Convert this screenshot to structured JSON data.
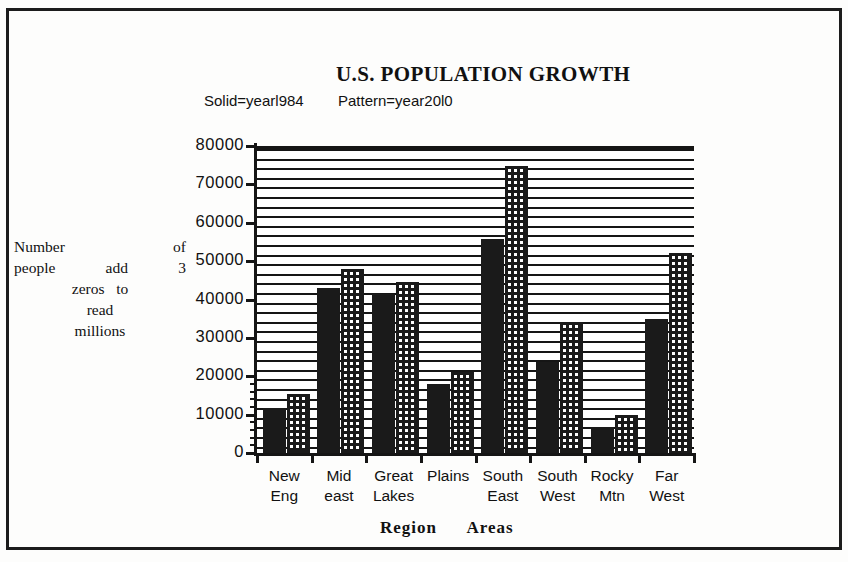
{
  "chart_data": {
    "type": "bar",
    "title": "U.S. POPULATION GROWTH",
    "xlabel": "Region Areas",
    "ylabel": "Number of people add 3 zeros to read millions",
    "categories": [
      "New Eng",
      "Mid east",
      "Great Lakes",
      "Plains",
      "South East",
      "South West",
      "Rocky Mtn",
      "Far West"
    ],
    "category_lines": [
      {
        "l1": "New",
        "l2": "Eng"
      },
      {
        "l1": "Mid",
        "l2": "east"
      },
      {
        "l1": "Great",
        "l2": "Lakes"
      },
      {
        "l1": "Plains",
        "l2": ""
      },
      {
        "l1": "South",
        "l2": "East"
      },
      {
        "l1": "South",
        "l2": "West"
      },
      {
        "l1": "Rocky",
        "l2": "Mtn"
      },
      {
        "l1": "Far",
        "l2": "West"
      }
    ],
    "series": [
      {
        "name": "Solid=yearl984",
        "fill": "solid",
        "values": [
          11800,
          43000,
          41500,
          18000,
          55800,
          23600,
          6800,
          34800
        ]
      },
      {
        "name": "Pattern=year20l0",
        "fill": "pattern",
        "values": [
          15400,
          48000,
          44500,
          21000,
          74800,
          34200,
          9800,
          52200
        ]
      }
    ],
    "ylim": [
      0,
      80000
    ],
    "ytick_values": [
      0,
      10000,
      20000,
      30000,
      40000,
      50000,
      60000,
      70000,
      80000
    ],
    "ytick_labels": [
      "0",
      "10000",
      "20000",
      "30000",
      "40000",
      "50000",
      "60000",
      "70000",
      "80000"
    ],
    "grid": "horizontal-dense",
    "legend_position": "above-plot-left",
    "colors": {
      "solid": "#1a1a1a",
      "pattern": "#1a1a1a",
      "axis": "#151515",
      "background": "#ffffff"
    }
  },
  "legend": {
    "solid_label": "Solid=yearl984",
    "pattern_label": "Pattern=year20l0"
  },
  "ylabel_lines": {
    "line1_a": "Number",
    "line1_b": "of",
    "line2_a": "people",
    "line2_b": "add",
    "line2_c": "3",
    "line3_a": "zeros",
    "line3_b": "to",
    "line4": "read",
    "line5": "millions"
  },
  "xtitle": {
    "word1": "Region",
    "word2": "Areas"
  }
}
